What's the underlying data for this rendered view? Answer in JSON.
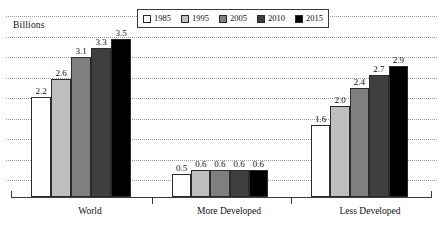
{
  "chart_data": {
    "type": "bar",
    "title": "",
    "subtitle": "",
    "xlabel": "",
    "ylabel": "Billions",
    "ylim": [
      0,
      3.6
    ],
    "grid": true,
    "gridlines_count": 9,
    "legend_position": "top-center",
    "categories": [
      "World",
      "More Developed",
      "Less Developed"
    ],
    "series": [
      {
        "name": "1985",
        "color": "#ffffff",
        "values": [
          2.2,
          0.5,
          1.6
        ],
        "labels": [
          "2.2",
          "0.5",
          "1.6"
        ]
      },
      {
        "name": "1995",
        "color": "#bfbfbf",
        "values": [
          2.6,
          0.6,
          2.0
        ],
        "labels": [
          "2.6",
          "0.6",
          "2.0"
        ]
      },
      {
        "name": "2005",
        "color": "#7f7f7f",
        "values": [
          3.1,
          0.6,
          2.4
        ],
        "labels": [
          "3.1",
          "0.6",
          "2.4"
        ]
      },
      {
        "name": "2010",
        "color": "#3f3f3f",
        "values": [
          3.3,
          0.6,
          2.7
        ],
        "labels": [
          "3.3",
          "0.6",
          "2.7"
        ]
      },
      {
        "name": "2015",
        "color": "#000000",
        "values": [
          3.5,
          0.6,
          2.9
        ],
        "labels": [
          "3.5",
          "0.6",
          "2.9"
        ]
      }
    ]
  },
  "axis": {
    "y_label": "Billions",
    "category_labels": [
      "World",
      "More Developed",
      "Less Developed"
    ]
  },
  "legend": {
    "entries": [
      {
        "label": "1985",
        "color": "#ffffff"
      },
      {
        "label": "1995",
        "color": "#bfbfbf"
      },
      {
        "label": "2005",
        "color": "#7f7f7f"
      },
      {
        "label": "2010",
        "color": "#3f3f3f"
      },
      {
        "label": "2015",
        "color": "#000000"
      }
    ]
  },
  "style": {
    "background": "#ffffff",
    "gridline_color": "#9a9a9a",
    "axis_color": "#3a3a3a",
    "bar_border_color": "#2b2b2b",
    "text_color": "#111111"
  }
}
